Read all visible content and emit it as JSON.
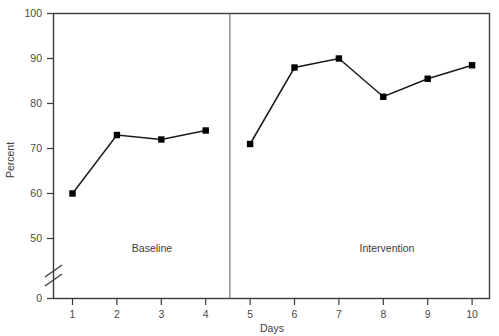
{
  "chart_data": {
    "type": "line",
    "title": "",
    "xlabel": "Days",
    "ylabel": "Percent",
    "x": [
      1,
      2,
      3,
      4,
      5,
      6,
      7,
      8,
      9,
      10
    ],
    "xtick_labels": [
      "1",
      "2",
      "3",
      "4",
      "5",
      "6",
      "7",
      "8",
      "9",
      "10"
    ],
    "ytick_labels": [
      "0",
      "50",
      "60",
      "70",
      "80",
      "90",
      "100"
    ],
    "ytick_values": [
      0,
      50,
      60,
      70,
      80,
      90,
      100
    ],
    "ylim": [
      0,
      100
    ],
    "xlim": [
      0.5,
      10.5
    ],
    "y_axis_break": true,
    "y_axis_break_between": [
      0,
      50
    ],
    "grid": false,
    "legend": "none",
    "marker": "square",
    "marker_color": "#000000",
    "line_color": "#1a1a1a",
    "series": [
      {
        "name": "Baseline",
        "x": [
          1,
          2,
          3,
          4
        ],
        "values": [
          60,
          73,
          72,
          74
        ]
      },
      {
        "name": "Intervention",
        "x": [
          5,
          6,
          7,
          8,
          9,
          10
        ],
        "values": [
          71,
          88,
          90,
          81.5,
          85.5,
          88.5
        ]
      }
    ],
    "annotations": [
      {
        "text": "Baseline",
        "x": 2.5,
        "y": 27,
        "role": "phase-label"
      },
      {
        "text": "Intervention",
        "x": 7.6,
        "y": 27,
        "role": "phase-label"
      }
    ],
    "phase_divider": {
      "x": 4.5,
      "label": "phase-change-line"
    }
  },
  "axes": {
    "y": {
      "title": "Percent",
      "ticks": [
        {
          "label": "100",
          "value": 100
        },
        {
          "label": "90",
          "value": 90
        },
        {
          "label": "80",
          "value": 80
        },
        {
          "label": "70",
          "value": 70
        },
        {
          "label": "60",
          "value": 60
        },
        {
          "label": "50",
          "value": 50
        },
        {
          "label": "0",
          "value": 0
        }
      ]
    },
    "x": {
      "title": "Days",
      "ticks": [
        {
          "label": "1"
        },
        {
          "label": "2"
        },
        {
          "label": "3"
        },
        {
          "label": "4"
        },
        {
          "label": "5"
        },
        {
          "label": "6"
        },
        {
          "label": "7"
        },
        {
          "label": "8"
        },
        {
          "label": "9"
        },
        {
          "label": "10"
        }
      ]
    }
  },
  "phases": {
    "baseline_label": "Baseline",
    "intervention_label": "Intervention"
  },
  "colors": {
    "frame": "#3b3b3b",
    "line": "#1a1a1a",
    "marker": "#000000",
    "divider": "#6b6b6b",
    "text": "#3c3c3c",
    "background": "#ffffff"
  }
}
